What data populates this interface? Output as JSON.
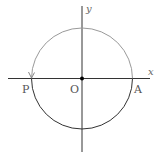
{
  "diagram": {
    "type": "unit-circle",
    "axes": {
      "x_label": "x",
      "y_label": "y"
    },
    "points": {
      "origin": "O",
      "point_a": "A",
      "point_p": "P"
    },
    "colors": {
      "axis": "#222222",
      "traced_arc": "#999999",
      "lower_arc": "#222222",
      "origin_dot": "#000000"
    }
  }
}
